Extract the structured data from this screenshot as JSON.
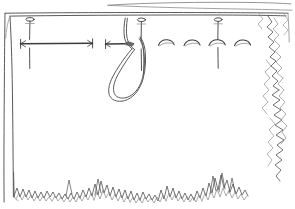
{
  "drawing": {
    "title": "Hand-drawn line sketch",
    "medium": "pencil line drawing",
    "background_color": "#ffffff",
    "ink_color": "#5a5a5a",
    "ink_dark_color": "#3c3c3c",
    "ink_light_color": "#8a8a8a",
    "width": 295,
    "height": 209
  },
  "frame": {
    "outer_top_label": "outer top edge line",
    "inner_top_label": "inner top edge line",
    "left_outer_label": "outer left vertical line",
    "left_inner_label": "inner left vertical line",
    "right_label": "right vertical edge"
  },
  "pins": [
    {
      "name": "pin-left",
      "x": 30,
      "head_y": 19,
      "tail_y": 68
    },
    {
      "name": "pin-center",
      "x": 141,
      "head_y": 19,
      "tail_y": 70
    },
    {
      "name": "pin-right",
      "x": 218,
      "head_y": 19,
      "tail_y": 68
    }
  ],
  "arrows": [
    {
      "name": "dimension-arrow-long",
      "x1": 20,
      "x2": 93,
      "y": 44
    },
    {
      "name": "dimension-arrow-short",
      "x1": 105,
      "x2": 133,
      "y": 44
    }
  ],
  "loop": {
    "name": "hanging-rope-loop",
    "top_x": 124,
    "bottom_y": 102
  },
  "arcs": [
    {
      "name": "arc-hook-1",
      "cx": 166,
      "cy": 43
    },
    {
      "name": "arc-hook-2",
      "cx": 192,
      "cy": 43
    },
    {
      "name": "arc-hook-3",
      "cx": 218,
      "cy": 43
    },
    {
      "name": "arc-hook-4",
      "cx": 243,
      "cy": 43
    }
  ],
  "textures": [
    {
      "name": "bottom-grass-texture",
      "orientation": "horizontal",
      "x_start": 14,
      "x_end": 250,
      "baseline_y": 198
    },
    {
      "name": "right-grass-texture",
      "orientation": "vertical",
      "y_start": 18,
      "y_end": 180,
      "baseline_x": 272
    }
  ]
}
